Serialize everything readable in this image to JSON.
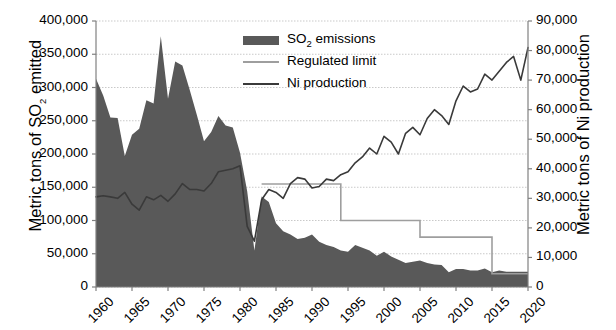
{
  "chart_data": {
    "type": "area",
    "title": "",
    "xlabel": "",
    "ylabel": "Metric tons of SO2 emitted",
    "ylabel_right": "Metric tons of Ni production",
    "grid": true,
    "legend_position": "top-center",
    "xlim": [
      1960,
      2020
    ],
    "ylim": [
      0,
      400000
    ],
    "ylim_right": [
      0,
      90000
    ],
    "x_ticks": [
      "1960",
      "1965",
      "1970",
      "1975",
      "1980",
      "1985",
      "1990",
      "1995",
      "2000",
      "2005",
      "2010",
      "2015",
      "2020"
    ],
    "y_ticks_left": [
      "0",
      "50,000",
      "100,000",
      "150,000",
      "200,000",
      "250,000",
      "300,000",
      "350,000",
      "400,000"
    ],
    "y_ticks_right": [
      "0",
      "10,000",
      "20,000",
      "30,000",
      "40,000",
      "50,000",
      "60,000",
      "70,000",
      "80,000",
      "90,000"
    ],
    "x": [
      1960,
      1961,
      1962,
      1963,
      1964,
      1965,
      1966,
      1967,
      1968,
      1969,
      1970,
      1971,
      1972,
      1973,
      1974,
      1975,
      1976,
      1977,
      1978,
      1979,
      1980,
      1981,
      1982,
      1983,
      1984,
      1985,
      1986,
      1987,
      1988,
      1989,
      1990,
      1991,
      1992,
      1993,
      1994,
      1995,
      1996,
      1997,
      1998,
      1999,
      2000,
      2001,
      2002,
      2003,
      2004,
      2005,
      2006,
      2007,
      2008,
      2009,
      2010,
      2011,
      2012,
      2013,
      2014,
      2015,
      2016,
      2017,
      2018,
      2019,
      2020
    ],
    "series": [
      {
        "name": "SO2 emissions",
        "axis": "left",
        "kind": "area",
        "color": "#595959",
        "values": [
          313000,
          288000,
          255000,
          254000,
          197000,
          229000,
          238000,
          281000,
          276000,
          377000,
          283000,
          339000,
          333000,
          297000,
          259000,
          219000,
          233000,
          257000,
          243000,
          240000,
          202000,
          144000,
          55000,
          136000,
          128000,
          96000,
          84000,
          79000,
          72000,
          74000,
          79000,
          68000,
          63000,
          60000,
          55000,
          53000,
          63000,
          59000,
          55000,
          47000,
          53000,
          46000,
          41000,
          36000,
          38000,
          40000,
          36000,
          34000,
          33000,
          22000,
          27000,
          27000,
          25000,
          25000,
          28000,
          22000,
          25000,
          23000,
          23000,
          23000,
          23000
        ]
      },
      {
        "name": "Regulated limit",
        "axis": "left",
        "kind": "step",
        "color": "#9e9e9e",
        "values": [
          null,
          null,
          null,
          null,
          null,
          null,
          null,
          null,
          null,
          null,
          null,
          null,
          null,
          null,
          null,
          null,
          null,
          null,
          null,
          null,
          null,
          null,
          null,
          155000,
          155000,
          155000,
          155000,
          155000,
          155000,
          155000,
          155000,
          155000,
          155000,
          155000,
          100000,
          100000,
          100000,
          100000,
          100000,
          100000,
          100000,
          100000,
          100000,
          100000,
          100000,
          75000,
          75000,
          75000,
          75000,
          75000,
          75000,
          75000,
          75000,
          75000,
          75000,
          20000,
          20000,
          20000,
          20000,
          20000,
          20000
        ]
      },
      {
        "name": "Ni production",
        "axis": "right",
        "kind": "line",
        "color": "#3a3a3a",
        "values": [
          30500,
          30900,
          30500,
          30000,
          32000,
          28000,
          26000,
          30500,
          29500,
          31000,
          29000,
          31500,
          35000,
          33000,
          33000,
          32500,
          35000,
          39000,
          39500,
          40000,
          41000,
          20500,
          15500,
          29500,
          33000,
          32000,
          30000,
          35000,
          37000,
          36500,
          33500,
          34000,
          36500,
          36000,
          38000,
          39000,
          42000,
          44000,
          47000,
          45000,
          51000,
          49000,
          45000,
          52000,
          54000,
          51500,
          57000,
          60000,
          58000,
          55000,
          63000,
          68000,
          66000,
          67000,
          72000,
          70000,
          73000,
          76000,
          78000,
          70000,
          81000
        ]
      }
    ],
    "legend": [
      {
        "label": "SO2 emissions",
        "marker": "area",
        "color": "#595959"
      },
      {
        "label": "Regulated limit",
        "marker": "line",
        "color": "#9e9e9e"
      },
      {
        "label": "Ni production",
        "marker": "line",
        "color": "#3a3a3a"
      }
    ]
  },
  "axes": {
    "left_title": "Metric tons of SO2 emitted",
    "right_title": "Metric tons of Ni production"
  }
}
